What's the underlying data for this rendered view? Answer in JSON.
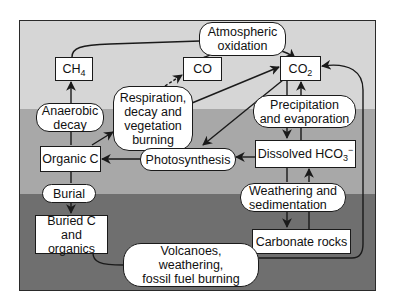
{
  "diagram": {
    "type": "carbon-cycle-flow",
    "zones": [
      {
        "name": "atmosphere",
        "color": "#d6d6d6"
      },
      {
        "name": "hydrosphere-biosphere",
        "color": "#a8a8a8"
      },
      {
        "name": "lithosphere",
        "color": "#6f6f6f"
      }
    ],
    "boxes": {
      "ch4": {
        "base": "CH",
        "sub": "4"
      },
      "co": {
        "label": "CO"
      },
      "co2": {
        "base": "CO",
        "sub": "2"
      },
      "organic_c": {
        "label": "Organic C"
      },
      "dissolved_hco3": {
        "base": "Dissolved HCO",
        "sub": "3",
        "sup": "−"
      },
      "buried_c": {
        "label": "Buried C\nand organics"
      },
      "carbonate_rocks": {
        "label": "Carbonate rocks"
      }
    },
    "processes": {
      "atmospheric_oxidation": {
        "label": "Atmospheric\noxidation"
      },
      "anaerobic_decay": {
        "label": "Anaerobic\ndecay"
      },
      "respiration": {
        "label": "Respiration,\ndecay and\nvegetation\nburning"
      },
      "photosynthesis": {
        "label": "Photosynthesis"
      },
      "precipitation": {
        "label": "Precipitation\nand evaporation"
      },
      "burial": {
        "label": "Burial"
      },
      "weathering": {
        "label": "Weathering and\nsedimentation"
      },
      "volcanoes": {
        "label": "Volcanoes,\nweathering,\nfossil fuel burning"
      }
    },
    "edges": [
      {
        "from": "Organic C",
        "to": "CH4",
        "via": "Anaerobic decay"
      },
      {
        "from": "CH4",
        "to": "CO2",
        "via": "Atmospheric oxidation"
      },
      {
        "from": "CO",
        "to": "CO2",
        "via": "Atmospheric oxidation"
      },
      {
        "from": "Organic C",
        "to": "CO",
        "via": "Respiration, decay and vegetation burning"
      },
      {
        "from": "Organic C",
        "to": "CO2",
        "via": "Respiration, decay and vegetation burning"
      },
      {
        "from": "CO2",
        "to": "Organic C",
        "via": "Photosynthesis"
      },
      {
        "from": "Dissolved HCO3-",
        "to": "Organic C",
        "via": "Photosynthesis"
      },
      {
        "from": "CO2",
        "to": "Dissolved HCO3-",
        "via": "Precipitation and evaporation"
      },
      {
        "from": "Dissolved HCO3-",
        "to": "CO2",
        "via": "Precipitation and evaporation"
      },
      {
        "from": "Organic C",
        "to": "Buried C and organics",
        "via": "Burial"
      },
      {
        "from": "Dissolved HCO3-",
        "to": "Carbonate rocks",
        "via": "Weathering and sedimentation"
      },
      {
        "from": "Carbonate rocks",
        "to": "Dissolved HCO3-",
        "via": "Weathering and sedimentation"
      },
      {
        "from": "Buried C and organics",
        "to": "CO2",
        "via": "Volcanoes, weathering, fossil fuel burning"
      },
      {
        "from": "Carbonate rocks",
        "to": "CO2",
        "via": "Volcanoes, weathering, fossil fuel burning"
      }
    ],
    "colors": {
      "line": "#1a1a1a",
      "box_fill": "#ffffff"
    }
  }
}
